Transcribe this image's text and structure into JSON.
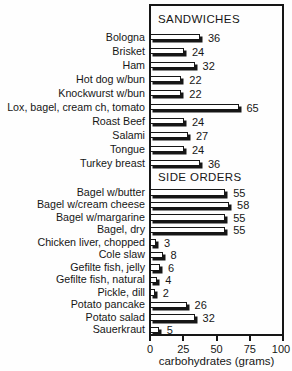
{
  "chart_data": {
    "type": "bar",
    "orientation": "horizontal",
    "xlabel": "carbohydrates (grams)",
    "xlim": [
      0,
      100
    ],
    "xticks": [
      0,
      25,
      50,
      75,
      100
    ],
    "grid": false,
    "legend": "none",
    "bar_fill_color": "#ffffff",
    "ink_color": "#161616",
    "background_color": "#fefefe",
    "sections": [
      {
        "title": "SANDWICHES",
        "items": [
          {
            "label": "Bologna",
            "value": 36
          },
          {
            "label": "Brisket",
            "value": 24
          },
          {
            "label": "Ham",
            "value": 32
          },
          {
            "label": "Hot dog w/bun",
            "value": 22
          },
          {
            "label": "Knockwurst w/bun",
            "value": 22
          },
          {
            "label": "Lox, bagel, cream ch, tomato",
            "value": 65
          },
          {
            "label": "Roast Beef",
            "value": 24
          },
          {
            "label": "Salami",
            "value": 27
          },
          {
            "label": "Tongue",
            "value": 24
          },
          {
            "label": "Turkey breast",
            "value": 36
          }
        ]
      },
      {
        "title": "SIDE ORDERS",
        "items": [
          {
            "label": "Bagel w/butter",
            "value": 55
          },
          {
            "label": "Bagel w/cream cheese",
            "value": 58
          },
          {
            "label": "Bagel w/margarine",
            "value": 55
          },
          {
            "label": "Bagel, dry",
            "value": 55
          },
          {
            "label": "Chicken liver, chopped",
            "value": 3
          },
          {
            "label": "Cole slaw",
            "value": 8
          },
          {
            "label": "Gefilte fish, jelly",
            "value": 6
          },
          {
            "label": "Gefilte fish, natural",
            "value": 4
          },
          {
            "label": "Pickle, dill",
            "value": 2
          },
          {
            "label": "Potato pancake",
            "value": 26
          },
          {
            "label": "Potato salad",
            "value": 32
          },
          {
            "label": "Sauerkraut",
            "value": 5
          }
        ]
      }
    ]
  }
}
